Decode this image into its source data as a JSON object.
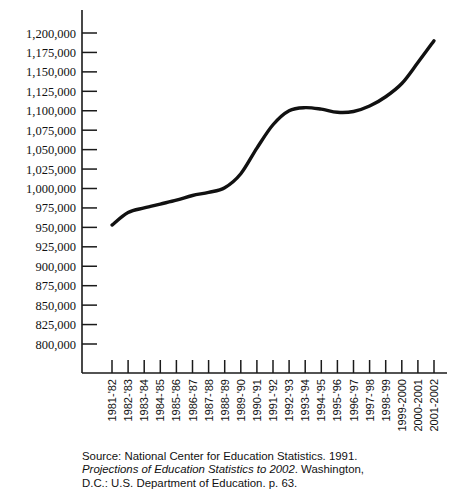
{
  "chart_data": {
    "type": "line",
    "title": "",
    "subtitle": "",
    "xlabel": "",
    "ylabel": "",
    "grid": false,
    "legend": false,
    "ylim": [
      800000,
      1200000
    ],
    "ytick_step": 25000,
    "ytick_labels": [
      "1,200,000",
      "1,175,000",
      "1,150,000",
      "1,125,000",
      "1,100,000",
      "1,075,000",
      "1,050,000",
      "1,025,000",
      "1,000,000",
      "975,000",
      "950,000",
      "925,000",
      "900,000",
      "875,000",
      "850,000",
      "825,000",
      "800,000"
    ],
    "ytick_values": [
      1200000,
      1175000,
      1150000,
      1125000,
      1100000,
      1075000,
      1050000,
      1025000,
      1000000,
      975000,
      950000,
      925000,
      900000,
      875000,
      850000,
      825000,
      800000
    ],
    "categories": [
      "1981-'82",
      "1982-'83",
      "1983-'84",
      "1984-'85",
      "1985-'86",
      "1986-'87",
      "1987-'88",
      "1988-'89",
      "1989-'90",
      "1990-'91",
      "1991-'92",
      "1992-'93",
      "1993-'94",
      "1994-'95",
      "1995-'96",
      "1996-'97",
      "1997-'98",
      "1998-'99",
      "1999-2000",
      "2000-2001",
      "2001-2002"
    ],
    "series": [
      {
        "name": "Bachelor's degrees conferred",
        "values": [
          953000,
          969000,
          975000,
          980000,
          985000,
          991000,
          995000,
          1001000,
          1019000,
          1052000,
          1082000,
          1100000,
          1104000,
          1102000,
          1098000,
          1099000,
          1106000,
          1118000,
          1135000,
          1162000,
          1190000
        ]
      }
    ]
  },
  "source": {
    "line1": "Source: National Center for Education Statistics. 1991.",
    "line2_italic": "Projections of Education Statistics to 2002",
    "line2_rest": ". Washington,",
    "line3": "D.C.: U.S. Department of Education. p. 63."
  }
}
